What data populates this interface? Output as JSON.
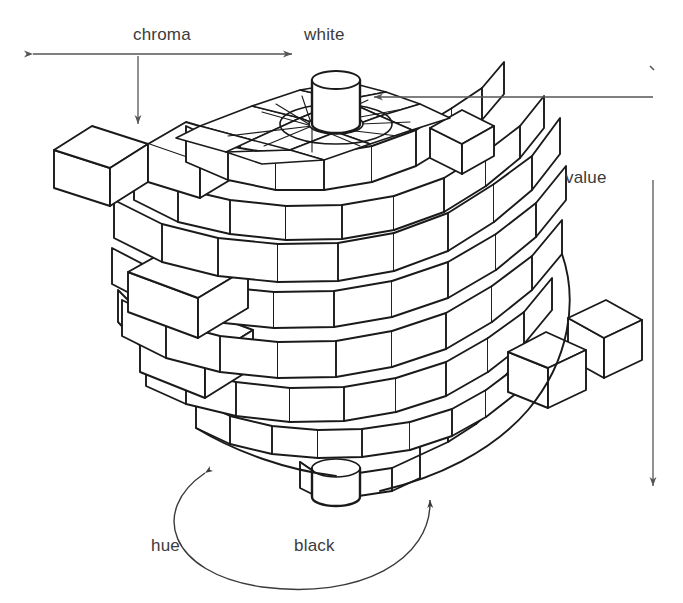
{
  "figure": {
    "background_color": "#ffffff",
    "line_color": "#1a1a1a",
    "annotation_color": "#555555",
    "text_color": "#3b3b3b"
  },
  "labels": {
    "chroma": "chroma",
    "white": "white",
    "value": "value",
    "hue": "hue",
    "black": "black"
  },
  "annotations": {
    "chroma_axis": {
      "label": "chroma",
      "type": "double-headed-horizontal-arrow",
      "x1": 27,
      "x2": 298,
      "y": 54,
      "leader": {
        "x": 138,
        "y1": 54,
        "y2": 131,
        "arrow": "down"
      }
    },
    "white_pointer": {
      "label": "white",
      "type": "single-headed-horizontal-arrow",
      "x1": 653,
      "x2": 368,
      "y": 97,
      "arrow": "left"
    },
    "value_axis": {
      "label": "value",
      "type": "vertical-line-with-arrow",
      "x": 653,
      "y1": 70,
      "y2": 492,
      "arrow": "down"
    },
    "hue_arc": {
      "label": "hue",
      "type": "double-headed-curved-arrow",
      "arrow_left": "up",
      "arrow_right": "up"
    }
  },
  "diagram": {
    "kind": "munsell-color-solid",
    "center_axis": {
      "top_cylinder": "white",
      "bottom_cylinder": "black"
    },
    "ring_count": 9
  }
}
